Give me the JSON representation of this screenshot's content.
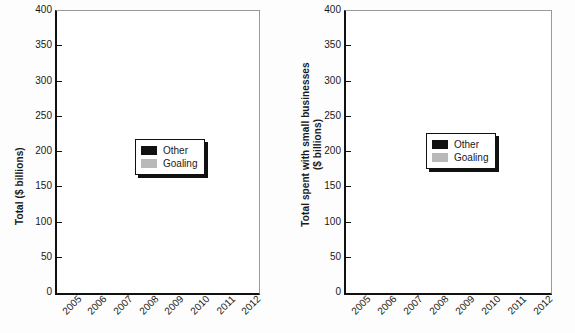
{
  "chart_data": [
    {
      "panel": "left",
      "type": "bar",
      "stacked": true,
      "title": "",
      "xlabel": "",
      "ylabel": "Total ($ billions)",
      "ylim": [
        0,
        400
      ],
      "yticks": [
        0,
        50,
        100,
        150,
        200,
        250,
        300,
        350,
        400
      ],
      "ytick_labels": [
        "0",
        "50",
        "100",
        "150",
        "200",
        "250",
        "300",
        "350",
        "400"
      ],
      "grid": false,
      "legend_position": "center-right-inside",
      "categories": [
        "2005",
        "2006",
        "2007",
        "2008",
        "2009",
        "2010",
        "2011",
        "2012"
      ],
      "series": [
        {
          "name": "Goaling",
          "color": "#b9b9b9",
          "values": [
            218,
            237,
            271,
            322,
            294,
            287,
            297,
            280
          ]
        },
        {
          "name": "Other",
          "color": "#111111",
          "values": [
            51,
            61,
            61,
            71,
            74,
            80,
            79,
            81
          ]
        }
      ],
      "totals": [
        269,
        298,
        332,
        393,
        368,
        367,
        376,
        361
      ]
    },
    {
      "panel": "right",
      "type": "bar",
      "stacked": true,
      "title": "",
      "xlabel": "",
      "ylabel": "Total spent with small businesses ($ billions)",
      "ylabel_line1": "Total spent with small businesses",
      "ylabel_line2": "($ billions)",
      "ylim": [
        0,
        400
      ],
      "yticks": [
        0,
        50,
        100,
        150,
        200,
        250,
        300,
        350,
        400
      ],
      "ytick_labels": [
        "0",
        "50",
        "100",
        "150",
        "200",
        "250",
        "300",
        "350",
        "400"
      ],
      "grid": false,
      "legend_position": "center-right-inside",
      "categories": [
        "2005",
        "2006",
        "2007",
        "2008",
        "2009",
        "2010",
        "2011",
        "2012"
      ],
      "series": [
        {
          "name": "Goaling",
          "color": "#b9b9b9",
          "values": [
            47,
            49,
            54,
            59,
            62,
            59,
            55,
            55
          ]
        },
        {
          "name": "Other",
          "color": "#111111",
          "values": [
            1.5,
            2,
            3,
            3,
            4,
            4,
            3,
            3
          ]
        }
      ],
      "totals": [
        48.5,
        51,
        57,
        62,
        66,
        63,
        58,
        58
      ]
    }
  ],
  "left_panel": {
    "ylabel": "Total ($ billions)",
    "legend": {
      "other_label": "Other",
      "goaling_label": "Goaling"
    }
  },
  "right_panel": {
    "ylabel_line1": "Total spent with small businesses",
    "ylabel_line2": "($ billions)",
    "legend": {
      "other_label": "Other",
      "goaling_label": "Goaling"
    }
  },
  "colors": {
    "other": "#111111",
    "goaling": "#b9b9b9",
    "axis": "#111111",
    "background": "#ffffff"
  }
}
